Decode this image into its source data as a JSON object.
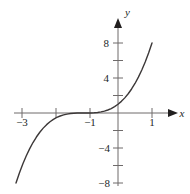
{
  "chart_data": {
    "type": "line",
    "title": "",
    "subtitle": "",
    "xlabel": "x",
    "ylabel": "y",
    "function": "y = (x + 1)^3",
    "xlim": [
      -3.2,
      1.4
    ],
    "ylim": [
      -9.5,
      9.5
    ],
    "grid": false,
    "legend": null,
    "x_ticks": [
      -3,
      -2,
      -1,
      1
    ],
    "x_tick_labels": [
      "−3",
      "",
      "−1",
      "1"
    ],
    "y_ticks": [
      -8,
      -6,
      -4,
      -2,
      2,
      4,
      6,
      8
    ],
    "y_tick_labels": [
      "−8",
      "",
      "−4",
      "",
      "",
      "4",
      "",
      "8"
    ],
    "x": [
      -3.0,
      -2.9,
      -2.8,
      -2.7,
      -2.6,
      -2.5,
      -2.4,
      -2.3,
      -2.2,
      -2.1,
      -2.0,
      -1.9,
      -1.8,
      -1.7,
      -1.6,
      -1.5,
      -1.4,
      -1.3,
      -1.2,
      -1.1,
      -1.0,
      -0.9,
      -0.8,
      -0.7,
      -0.6,
      -0.5,
      -0.4,
      -0.3,
      -0.2,
      -0.1,
      0.0,
      0.1,
      0.2,
      0.3,
      0.4,
      0.5,
      0.6,
      0.7,
      0.8,
      0.9,
      1.0
    ],
    "y": [
      -8.0,
      -6.859,
      -5.832,
      -4.913,
      -4.096,
      -3.375,
      -2.744,
      -2.197,
      -1.728,
      -1.331,
      -1.0,
      -0.729,
      -0.512,
      -0.343,
      -0.216,
      -0.125,
      -0.064,
      -0.027,
      -0.008,
      -0.001,
      0.0,
      0.001,
      0.008,
      0.027,
      0.064,
      0.125,
      0.216,
      0.343,
      0.512,
      0.729,
      1.0,
      1.331,
      1.728,
      2.197,
      2.744,
      3.375,
      4.096,
      4.913,
      5.832,
      6.859,
      8.0
    ],
    "series": [
      {
        "name": "cubic-curve",
        "values": [
          -8.0,
          -6.859,
          -5.832,
          -4.913,
          -4.096,
          -3.375,
          -2.744,
          -2.197,
          -1.728,
          -1.331,
          -1.0,
          -0.729,
          -0.512,
          -0.343,
          -0.216,
          -0.125,
          -0.064,
          -0.027,
          -0.008,
          -0.001,
          0.0,
          0.001,
          0.008,
          0.027,
          0.064,
          0.125,
          0.216,
          0.343,
          0.512,
          0.729,
          1.0,
          1.331,
          1.728,
          2.197,
          2.744,
          3.375,
          4.096,
          4.913,
          5.832,
          6.859,
          8.0
        ]
      }
    ],
    "colors": {
      "curve": "#3c3838",
      "axis": "#6e6a6a",
      "text": "#221f1f",
      "background": "#ffffff"
    }
  },
  "labels": {
    "x_axis_name": "x",
    "y_axis_name": "y",
    "x_tick_neg3": "−3",
    "x_tick_neg1": "−1",
    "x_tick_pos1": "1",
    "y_tick_pos8": "8",
    "y_tick_pos4": "4",
    "y_tick_neg4": "−4",
    "y_tick_neg8": "−8"
  }
}
